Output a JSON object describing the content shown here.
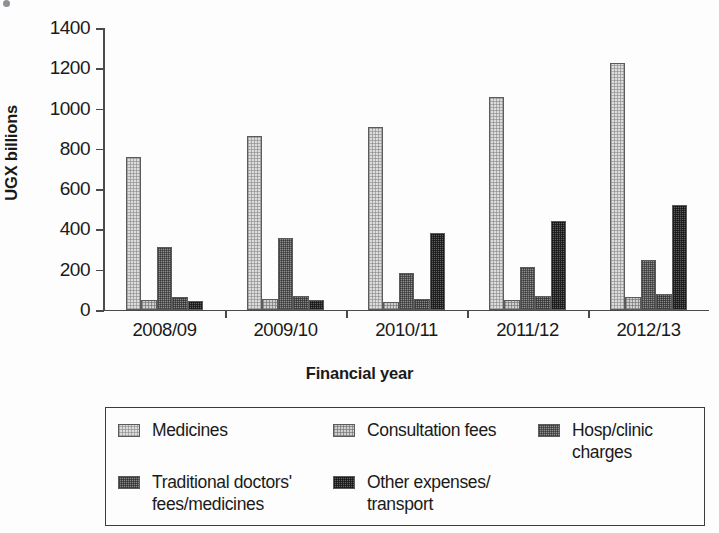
{
  "caption_strip": {
    "text": "",
    "bullet_icon": "bullet-dot-icon"
  },
  "axis": {
    "y_title": "UGX billions",
    "x_title": "Financial year",
    "y_ticks": [
      "1400",
      "1200",
      "1000",
      "800",
      "600",
      "400",
      "200",
      "0"
    ],
    "x_ticks": [
      "2008/09",
      "2009/10",
      "2010/11",
      "2011/12",
      "2012/13"
    ]
  },
  "legend": {
    "rows": [
      [
        {
          "label": "Medicines",
          "swatch": "legend-swatch-medicines",
          "series_index": 0
        },
        {
          "label": "Consultation fees",
          "swatch": "legend-swatch-consultation-fees",
          "series_index": 1
        },
        {
          "label": "Hosp/clinic\ncharges",
          "swatch": "legend-swatch-hosp-clinic-charges",
          "series_index": 2
        }
      ],
      [
        {
          "label": "Traditional doctors'\nfees/medicines",
          "swatch": "legend-swatch-traditional-doctors-fees",
          "series_index": 3
        },
        {
          "label": "Other expenses/\ntransport",
          "swatch": "legend-swatch-other-expenses-transport",
          "series_index": 4
        }
      ]
    ]
  },
  "colors": {
    "axis": "#4a4a4a",
    "text": "#1a1a1a",
    "legend_border": "#3c3c3c",
    "series": [
      "#dcdcdc",
      "#cfcfcf",
      "#8e8e8e",
      "#888888",
      "#5e5e5e"
    ]
  },
  "chart_data": {
    "type": "bar",
    "title": "",
    "xlabel": "Financial year",
    "ylabel": "UGX billions",
    "categories": [
      "2008/09",
      "2009/10",
      "2010/11",
      "2011/12",
      "2012/13"
    ],
    "ylim": [
      0,
      1400
    ],
    "ytick_interval": 200,
    "grid": false,
    "legend_position": "bottom",
    "grouped": true,
    "series": [
      {
        "name": "Medicines",
        "values": [
          760,
          862,
          910,
          1058,
          1228
        ]
      },
      {
        "name": "Consultation fees",
        "values": [
          50,
          55,
          42,
          50,
          65
        ]
      },
      {
        "name": "Hosp/clinic charges",
        "values": [
          315,
          358,
          182,
          212,
          248
        ]
      },
      {
        "name": "Traditional doctors' fees/medicines",
        "values": [
          65,
          72,
          55,
          70,
          80
        ]
      },
      {
        "name": "Other expenses/transport",
        "values": [
          45,
          52,
          382,
          440,
          520
        ]
      }
    ]
  }
}
